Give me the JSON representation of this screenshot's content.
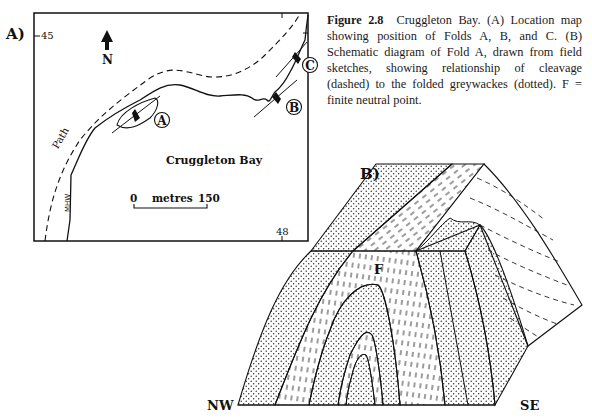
{
  "figure": {
    "number": "Figure 2.8",
    "caption": "Cruggleton Bay. (A) Location map showing position of Folds A, B, and C. (B) Schematic diagram of Fold A, drawn from field sketches, showing relationship of cleavage (dashed) to the folded greywackes (dotted). F = finite neutral point."
  },
  "panel_a": {
    "label": "A)",
    "grid_ticks": {
      "top_left": "45",
      "bottom_right": "48"
    },
    "north_label": "N",
    "place_name": "Cruggleton Bay",
    "path_label": "Path",
    "mhw_label": "MHW",
    "scale": {
      "start": "0",
      "unit": "metres",
      "end": "150"
    },
    "folds": [
      {
        "id": "A"
      },
      {
        "id": "B"
      },
      {
        "id": "C"
      }
    ]
  },
  "panel_b": {
    "label": "B)",
    "neutral_point_label": "F",
    "orientation": {
      "left": "NW",
      "right": "SE"
    }
  }
}
